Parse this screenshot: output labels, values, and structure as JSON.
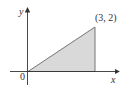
{
  "diagram": {
    "type": "shaded-triangle-region",
    "axes": {
      "x_label": "x",
      "y_label": "y",
      "origin_label": "0"
    },
    "vertices": [
      [
        0,
        0
      ],
      [
        3,
        0
      ],
      [
        3,
        2
      ]
    ],
    "point_label": "(3, 2)",
    "colors": {
      "fill": "#d9d9d9",
      "stroke": "#555555",
      "axis": "#333333"
    }
  }
}
